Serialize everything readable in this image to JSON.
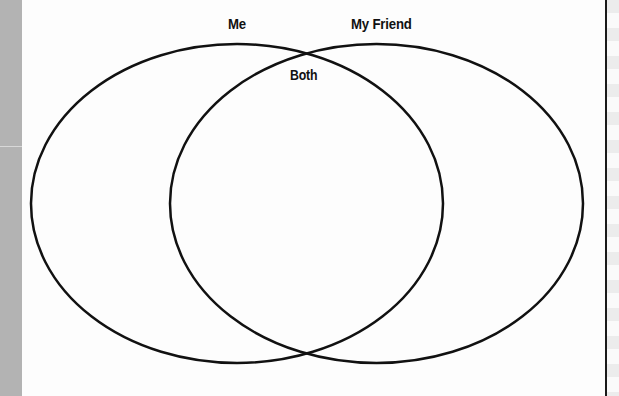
{
  "diagram": {
    "type": "venn",
    "sets": [
      {
        "label": "Me",
        "cx": 237,
        "cy": 203.5,
        "rx": 206,
        "ry": 159.5
      },
      {
        "label": "My Friend",
        "cx": 376.5,
        "cy": 203.5,
        "rx": 206.5,
        "ry": 159.5
      }
    ],
    "intersection_label": "Both",
    "stroke_color": "#111111",
    "stroke_width": 2.5
  },
  "labels": {
    "left_set": "Me",
    "right_set": "My Friend",
    "intersection": "Both"
  },
  "colors": {
    "left_band": "#b3b3b3",
    "page": "#fdfdfd",
    "rule": "#1a1a1a"
  }
}
